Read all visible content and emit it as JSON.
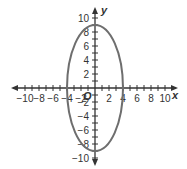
{
  "chart_data": {
    "type": "line",
    "title": "",
    "xlabel": "x",
    "ylabel": "y",
    "origin_label": "O",
    "xlim": [
      -10,
      10
    ],
    "ylim": [
      -10,
      10
    ],
    "grid": false,
    "x_ticks": [
      -10,
      -8,
      -6,
      -4,
      -2,
      2,
      4,
      6,
      8,
      10
    ],
    "y_ticks": [
      10,
      8,
      6,
      4,
      2,
      -2,
      -4,
      -6,
      -8,
      -10
    ],
    "x_tick_labels": [
      "−10",
      "−8",
      "−6",
      "−4",
      "−2",
      "2",
      "4",
      "6",
      "8",
      "10"
    ],
    "y_tick_labels": [
      "10",
      "8",
      "6",
      "4",
      "2",
      "−2",
      "−4",
      "−6",
      "−8",
      "−10"
    ],
    "series": [
      {
        "name": "ellipse",
        "shape": "ellipse",
        "center": [
          0,
          0
        ],
        "semi_axis_x": 4,
        "semi_axis_y": 9,
        "equation": "x^2/16 + y^2/81 = 1",
        "color": "#6e6e6e"
      }
    ]
  },
  "colors": {
    "axis": "#333333",
    "curve": "#6e6e6e"
  }
}
